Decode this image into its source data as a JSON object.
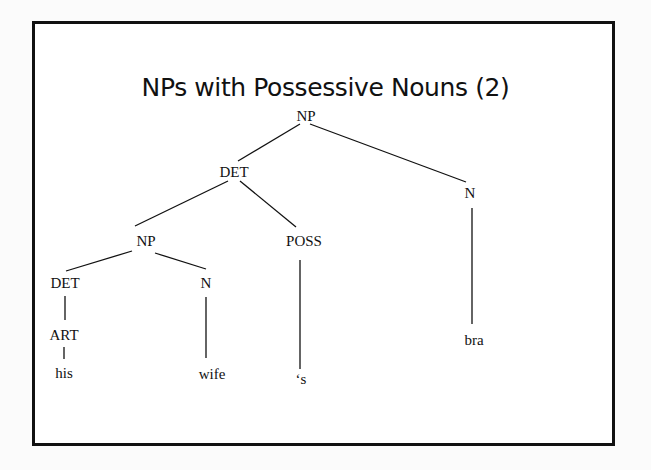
{
  "slide": {
    "title": "NPs with Possessive Nouns (2)"
  },
  "tree": {
    "nodes": {
      "root_np": "NP",
      "det_top": "DET",
      "n_top": "N",
      "np_inner": "NP",
      "poss": "POSS",
      "det_inner": "DET",
      "n_inner": "N",
      "art": "ART",
      "leaf_his": "his",
      "leaf_wife": "wife",
      "leaf_s": "‘s",
      "leaf_bra": "bra"
    },
    "structure": "[NP [DET [NP [DET [ART his]] [N wife]] [POSS 's]] [N bra]]"
  }
}
